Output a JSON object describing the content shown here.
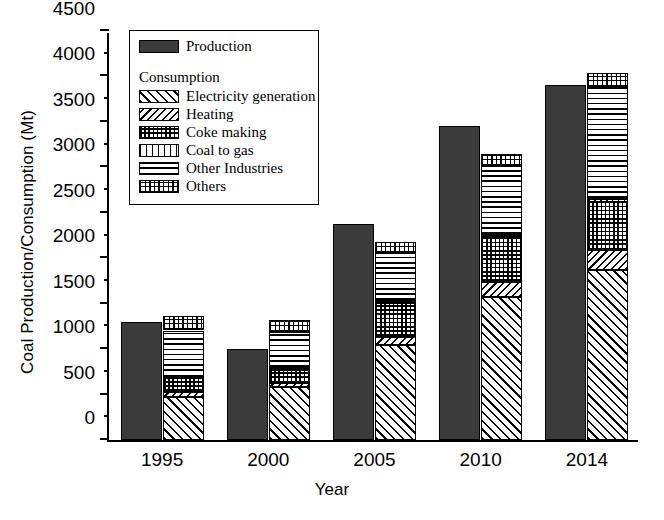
{
  "chart_data": {
    "type": "bar",
    "title": "",
    "subtitle": "",
    "xlabel": "Year",
    "ylabel": "Coal Production/Consumption (Mt)",
    "categories": [
      "1995",
      "2000",
      "2005",
      "2010",
      "2014"
    ],
    "ylim": [
      0,
      4500
    ],
    "y_ticks": [
      0,
      500,
      1000,
      1500,
      2000,
      2500,
      3000,
      3500,
      4000,
      4500
    ],
    "y_minor_ticks": [
      250,
      750,
      1250,
      1750,
      2250,
      2750,
      3250,
      3750,
      4250
    ],
    "grid": false,
    "legend_position": "upper-left",
    "bar_groups": "paired: production bar + stacked consumption bar per year",
    "production": {
      "name": "Production",
      "values": [
        1300,
        1000,
        2380,
        3450,
        3910
      ],
      "color": "#3b3b3b",
      "pattern": "solid"
    },
    "consumption_label": "Consumption",
    "consumption_series": [
      {
        "name": "Electricity generation",
        "pattern": "forward-diagonal-hatch",
        "values": [
          470,
          580,
          1040,
          1570,
          1870
        ]
      },
      {
        "name": "Heating",
        "pattern": "backward-diagonal-hatch",
        "values": [
          60,
          50,
          95,
          165,
          225
        ]
      },
      {
        "name": "Coke making",
        "pattern": "dense-crosshatch",
        "values": [
          150,
          145,
          375,
          500,
          525
        ]
      },
      {
        "name": "Coal to gas",
        "pattern": "vertical-lines",
        "values": [
          15,
          15,
          15,
          25,
          30
        ]
      },
      {
        "name": "Other Industries",
        "pattern": "horizontal-lines",
        "values": [
          510,
          395,
          535,
          760,
          1235
        ]
      },
      {
        "name": "Others",
        "pattern": "fine-grid",
        "values": [
          160,
          140,
          120,
          125,
          150
        ]
      }
    ],
    "consumption_totals": [
      1365,
      1325,
      2180,
      3145,
      4035
    ]
  }
}
